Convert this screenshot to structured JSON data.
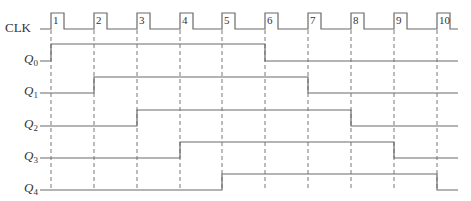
{
  "diagram": {
    "type": "timing-diagram",
    "title": "",
    "clock": {
      "label": "CLK",
      "pulse_numbers": [
        "1",
        "2",
        "3",
        "4",
        "5",
        "6",
        "7",
        "8",
        "9",
        "10"
      ],
      "rising_edges_x": [
        51,
        94,
        137,
        180,
        222,
        265,
        308,
        351,
        394,
        437
      ],
      "pulse_width": 13,
      "high_y": 13,
      "low_y": 29,
      "start_x": 40,
      "end_x": 458
    },
    "signals": [
      {
        "label": "Q",
        "subscript": "0",
        "label_y": 47,
        "high_y": 44,
        "low_y": 61,
        "rise_at_pulse": 1,
        "fall_at_pulse": 6
      },
      {
        "label": "Q",
        "subscript": "1",
        "label_y": 96,
        "high_y": 77,
        "low_y": 93,
        "rise_at_pulse": 2,
        "fall_at_pulse": 7
      },
      {
        "label": "Q",
        "subscript": "2",
        "label_y": 129,
        "high_y": 110,
        "low_y": 126,
        "rise_at_pulse": 3,
        "fall_at_pulse": 8
      },
      {
        "label": "Q",
        "subscript": "3",
        "label_y": 161,
        "high_y": 142,
        "low_y": 158,
        "rise_at_pulse": 4,
        "fall_at_pulse": 9
      },
      {
        "label": "Q",
        "subscript": "4",
        "label_y": 193,
        "high_y": 174,
        "low_y": 190,
        "rise_at_pulse": 5,
        "fall_at_pulse": 10
      }
    ],
    "signal_start_x": 40,
    "signal_end_x": 458,
    "dashed_guides": {
      "from_y": 30,
      "to_y": 190
    },
    "colors": {
      "line": "#6a6a6a",
      "text": "#333333",
      "background": "#ffffff"
    }
  }
}
